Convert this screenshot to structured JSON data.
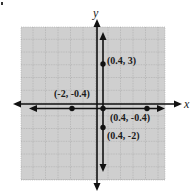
{
  "diagram": {
    "type": "coordinate-plane",
    "axes": {
      "x_label": "x",
      "y_label": "y"
    },
    "colors": {
      "grid_bg": "#cfcfcf",
      "grid_line": "#8a8a8a",
      "ink": "#111111",
      "background": "#ffffff"
    },
    "lines": [
      {
        "id": "vertical-line",
        "orientation": "vertical",
        "x_value": 0.4
      },
      {
        "id": "horizontal-line",
        "orientation": "horizontal",
        "y_value": -0.4
      }
    ],
    "points": [
      {
        "label": "(0.4, 3)"
      },
      {
        "label": "(-2, -0.4)"
      },
      {
        "label": "(0.4, -0.4)"
      },
      {
        "label": "(0.4, -2)"
      }
    ]
  }
}
